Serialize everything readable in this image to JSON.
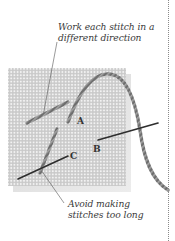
{
  "diagram": {
    "annotations": {
      "top": {
        "line1": "Work each stitch in a",
        "line2": "different direction"
      },
      "bottom": {
        "line1": "Avoid making",
        "line2": "stitches too long"
      }
    },
    "point_labels": {
      "a": "A",
      "b": "B",
      "c": "C"
    },
    "colors": {
      "canvas": "#d8d8d8",
      "canvas_holes": "#f4f4f4",
      "thread": "#6a6a6a",
      "needle": "#333333",
      "text": "#3a3a3a",
      "divider": "#8a8a8a"
    }
  }
}
